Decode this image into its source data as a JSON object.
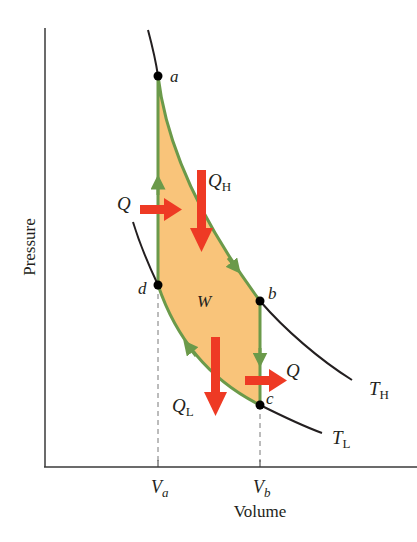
{
  "diagram": {
    "axes": {
      "y_label": "Pressure",
      "x_label": "Volume",
      "x_ticks": [
        {
          "main": "V",
          "sub": "a"
        },
        {
          "main": "V",
          "sub": "b"
        }
      ]
    },
    "points": {
      "a": "a",
      "b": "b",
      "c": "c",
      "d": "d"
    },
    "isotherms": {
      "high": {
        "main": "T",
        "sub": "H"
      },
      "low": {
        "main": "T",
        "sub": "L"
      }
    },
    "heat_labels": {
      "q_in_left": "Q",
      "q_h": {
        "main": "Q",
        "sub": "H"
      },
      "q_l": {
        "main": "Q",
        "sub": "L"
      },
      "q_out_right": "Q"
    },
    "work_label": "W",
    "colors": {
      "fill": "#f9c47a",
      "cycle_edge": "#6b9a4a",
      "arrow": "#ee3a24",
      "curve": "#231f20",
      "axis": "#3a3a3a"
    }
  }
}
